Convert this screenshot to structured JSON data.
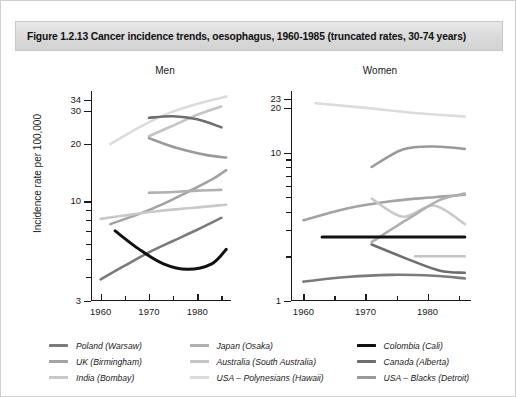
{
  "title": "Figure 1.2.13  Cancer incidence trends, oesophagus, 1960-1985 (truncated rates, 30-74 years)",
  "axis": {
    "ylabel": "Incidence rate per 100,000",
    "xticklabels": [
      "1960",
      "1970",
      "1980"
    ]
  },
  "panels": {
    "men": {
      "label": "Men",
      "yticklabels": [
        "34",
        "30",
        "20",
        "10",
        "3"
      ]
    },
    "women": {
      "label": "Women",
      "yticklabels": [
        "23",
        "20",
        "10",
        "1"
      ]
    }
  },
  "legend": {
    "columns": [
      [
        {
          "label": "Poland (Warsaw)",
          "color": "#7b7b7b"
        },
        {
          "label": "UK (Birmingham)",
          "color": "#a3a3a3"
        },
        {
          "label": "India (Bombay)",
          "color": "#c9c9c9"
        }
      ],
      [
        {
          "label": "Japan (Osaka)",
          "color": "#b0b0b0"
        },
        {
          "label": "Australia (South Australia)",
          "color": "#c4c4c4"
        },
        {
          "label": "USA – Polynesians (Hawaii)",
          "color": "#dcdcdc"
        }
      ],
      [
        {
          "label": "Colombia (Cali)",
          "color": "#111111"
        },
        {
          "label": "Canada (Alberta)",
          "color": "#6e6e6e"
        },
        {
          "label": "USA – Blacks (Detroit)",
          "color": "#9a9a9a"
        }
      ]
    ]
  },
  "chart_data": {
    "type": "line",
    "title": "Cancer incidence trends, oesophagus, 1960-1985 (truncated rates, 30-74 years)",
    "xlabel": "",
    "ylabel": "Incidence rate per 100,000",
    "yscale": "log",
    "grid": false,
    "legend_position": "below",
    "xlim": [
      1958,
      1987
    ],
    "panels": [
      {
        "name": "Men",
        "ylim": [
          3,
          38
        ],
        "yticks": [
          3,
          10,
          20,
          30,
          34
        ],
        "series": [
          {
            "name": "Poland (Warsaw)",
            "color": "#7b7b7b",
            "x": [
              1960,
              1965,
              1970,
              1975,
              1980,
              1985
            ],
            "y": [
              3.9,
              4.6,
              5.4,
              6.2,
              7.1,
              8.2
            ]
          },
          {
            "name": "UK (Birmingham)",
            "color": "#a3a3a3",
            "x": [
              1962,
              1968,
              1973,
              1978,
              1983,
              1986
            ],
            "y": [
              7.6,
              8.6,
              9.7,
              11.2,
              13.0,
              14.6
            ]
          },
          {
            "name": "India (Bombay)",
            "color": "#c9c9c9",
            "x": [
              1960,
              1966,
              1972,
              1978,
              1984,
              1986
            ],
            "y": [
              8.1,
              8.5,
              8.9,
              9.2,
              9.5,
              9.6
            ]
          },
          {
            "name": "Japan (Osaka)",
            "color": "#b0b0b0",
            "x": [
              1970,
              1975,
              1980,
              1985
            ],
            "y": [
              11.1,
              11.2,
              11.4,
              11.5
            ]
          },
          {
            "name": "Australia (South Australia)",
            "color": "#c4c4c4",
            "x": [
              1970,
              1975,
              1980,
              1985
            ],
            "y": [
              22.0,
              25.0,
              28.5,
              31.5
            ]
          },
          {
            "name": "USA – Polynesians (Hawaii)",
            "color": "#dcdcdc",
            "x": [
              1962,
              1968,
              1974,
              1980,
              1986
            ],
            "y": [
              20.0,
              24.5,
              29.0,
              32.5,
              35.5
            ]
          },
          {
            "name": "Colombia (Cali)",
            "color": "#111111",
            "x": [
              1963,
              1968,
              1973,
              1978,
              1983,
              1986
            ],
            "y": [
              7.0,
              5.6,
              4.7,
              4.4,
              4.7,
              5.6
            ]
          },
          {
            "name": "Canada (Alberta)",
            "color": "#6e6e6e",
            "x": [
              1970,
              1975,
              1980,
              1985
            ],
            "y": [
              27.5,
              28.0,
              27.0,
              24.5
            ]
          },
          {
            "name": "USA – Blacks (Detroit)",
            "color": "#9a9a9a",
            "x": [
              1970,
              1976,
              1982,
              1986
            ],
            "y": [
              21.5,
              19.0,
              17.5,
              17.0
            ]
          }
        ]
      },
      {
        "name": "Women",
        "ylim": [
          1,
          26
        ],
        "yticks": [
          1,
          10,
          20,
          23
        ],
        "series": [
          {
            "name": "Poland (Warsaw)",
            "color": "#7b7b7b",
            "x": [
              1960,
              1967,
              1974,
              1981,
              1986
            ],
            "y": [
              1.35,
              1.45,
              1.5,
              1.48,
              1.42
            ]
          },
          {
            "name": "UK (Birmingham)",
            "color": "#a3a3a3",
            "x": [
              1960,
              1967,
              1974,
              1981,
              1986
            ],
            "y": [
              3.5,
              4.2,
              4.7,
              5.0,
              5.2
            ]
          },
          {
            "name": "India (Bombay)",
            "color": "#c9c9c9",
            "x": [
              1971,
              1976,
              1981,
              1986
            ],
            "y": [
              4.9,
              3.7,
              4.4,
              3.3
            ]
          },
          {
            "name": "Japan (Osaka)",
            "color": "#b0b0b0",
            "x": [
              1971,
              1977,
              1982,
              1986
            ],
            "y": [
              2.5,
              3.6,
              4.8,
              5.3
            ]
          },
          {
            "name": "Australia (South Australia)",
            "color": "#c4c4c4",
            "x": [
              1978,
              1986
            ],
            "y": [
              2.0,
              2.0
            ]
          },
          {
            "name": "USA – Polynesians (Hawaii)",
            "color": "#dcdcdc",
            "x": [
              1962,
              1970,
              1978,
              1986
            ],
            "y": [
              21.5,
              20.0,
              18.5,
              17.5
            ]
          },
          {
            "name": "Colombia (Cali)",
            "color": "#111111",
            "x": [
              1963,
              1986
            ],
            "y": [
              2.7,
              2.7
            ]
          },
          {
            "name": "Canada (Alberta)",
            "color": "#6e6e6e",
            "x": [
              1971,
              1977,
              1982,
              1986
            ],
            "y": [
              2.4,
              1.9,
              1.6,
              1.55
            ]
          },
          {
            "name": "USA – Blacks (Detroit)",
            "color": "#9a9a9a",
            "x": [
              1971,
              1976,
              1981,
              1986
            ],
            "y": [
              8.0,
              10.5,
              11.0,
              10.6
            ]
          }
        ]
      }
    ]
  }
}
